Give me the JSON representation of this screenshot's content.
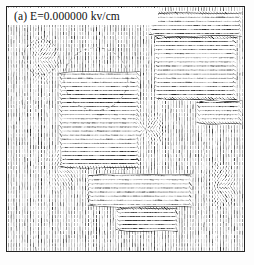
{
  "figure": {
    "panel_label": "(a)  E=0.000000 kv/cm",
    "panel_letter": "(a)",
    "field_symbol": "E",
    "field_value": "0.000000",
    "field_unit": "kv/cm",
    "frame_color": "#232323",
    "background_color": "#ffffff",
    "segment_color": "#101010",
    "annotation_color": "#2a2a2a"
  },
  "chart_data": {
    "type": "scatter",
    "title": "(a)  E=0.000000 kv/cm",
    "xlabel": "",
    "ylabel": "",
    "grid": false,
    "legend": null,
    "field": {
      "grid_cols": 86,
      "grid_rows": 60,
      "default_angle_deg": 90,
      "segment_length_px": 3.6,
      "angle_units": "degrees from horizontal"
    },
    "domains": [
      {
        "name": "right-upper-horizontal-domain",
        "x0": 0.6,
        "y0": 0.02,
        "x1": 0.99,
        "y1": 0.12,
        "angle_deg": 4
      },
      {
        "name": "right-main-horizontal-domain",
        "x0": 0.62,
        "y0": 0.12,
        "x1": 0.97,
        "y1": 0.38,
        "angle_deg": 2
      },
      {
        "name": "center-left-horizontal-domain",
        "x0": 0.22,
        "y0": 0.26,
        "x1": 0.56,
        "y1": 0.66,
        "angle_deg": 3
      },
      {
        "name": "bottom-center-horizontal-domain",
        "x0": 0.34,
        "y0": 0.68,
        "x1": 0.78,
        "y1": 0.82,
        "angle_deg": 2
      },
      {
        "name": "bottom-center-small-domain",
        "x0": 0.46,
        "y0": 0.82,
        "x1": 0.72,
        "y1": 0.92,
        "angle_deg": 5
      },
      {
        "name": "right-edge-lower-domain",
        "x0": 0.8,
        "y0": 0.38,
        "x1": 0.99,
        "y1": 0.48,
        "angle_deg": 8
      }
    ],
    "defects": [
      {
        "name": "star-defect-center",
        "x": 0.585,
        "y": 0.5,
        "charge": 1.0
      },
      {
        "name": "defect-upper-left",
        "x": 0.145,
        "y": 0.215,
        "charge": 0.5
      },
      {
        "name": "defect-left-lower",
        "x": 0.225,
        "y": 0.665,
        "charge": 0.5
      },
      {
        "name": "defect-right-mid",
        "x": 0.895,
        "y": 0.735,
        "charge": 0.5
      }
    ],
    "annotations": [
      {
        "name": "dashed-circle-upper-left",
        "shape": "circle",
        "cx": 0.145,
        "cy": 0.205,
        "r": 0.075
      },
      {
        "name": "dashed-circle-center-left",
        "shape": "circle",
        "cx": 0.375,
        "cy": 0.295,
        "r": 0.135
      }
    ]
  }
}
